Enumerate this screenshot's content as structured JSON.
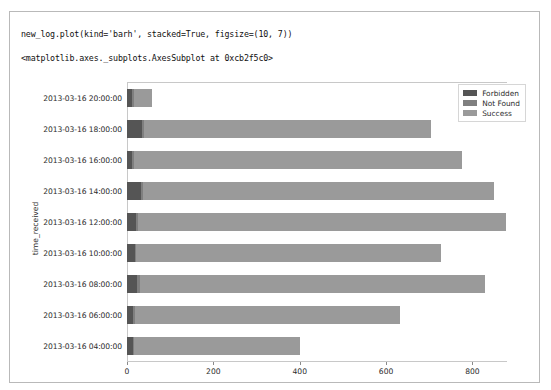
{
  "cell": {
    "input_code": "new_log.plot(kind='barh', stacked=True, figsize=(10, 7))",
    "output_text": "<matplotlib.axes._subplots.AxesSubplot at 0xcb2f5c0>"
  },
  "colors": {
    "forbidden": "#555555",
    "not_found": "#7f7f7f",
    "success": "#9a9a9a",
    "frame": "#c8c8c8",
    "tick_text": "#2b2b2b"
  },
  "chart_data": {
    "type": "bar",
    "orientation": "horizontal",
    "stacked": true,
    "title": "",
    "xlabel": "",
    "ylabel": "time_received",
    "xlim": [
      0,
      880
    ],
    "xticks": [
      0,
      200,
      400,
      600,
      800
    ],
    "grid": false,
    "legend_position": "upper right",
    "categories": [
      "2013-03-16 04:00:00",
      "2013-03-16 06:00:00",
      "2013-03-16 08:00:00",
      "2013-03-16 10:00:00",
      "2013-03-16 12:00:00",
      "2013-03-16 14:00:00",
      "2013-03-16 16:00:00",
      "2013-03-16 18:00:00",
      "2013-03-16 20:00:00"
    ],
    "series": [
      {
        "name": "Forbidden",
        "color": "#555555",
        "values": [
          14,
          15,
          22,
          18,
          20,
          33,
          12,
          34,
          12
        ]
      },
      {
        "name": "Not Found",
        "color": "#7f7f7f",
        "values": [
          3,
          4,
          7,
          4,
          6,
          5,
          4,
          6,
          4
        ]
      },
      {
        "name": "Success",
        "color": "#9a9a9a",
        "values": [
          383,
          613,
          800,
          705,
          851,
          812,
          760,
          665,
          42
        ]
      }
    ],
    "totals": [
      400,
      632,
      829,
      727,
      877,
      850,
      776,
      705,
      58
    ]
  }
}
